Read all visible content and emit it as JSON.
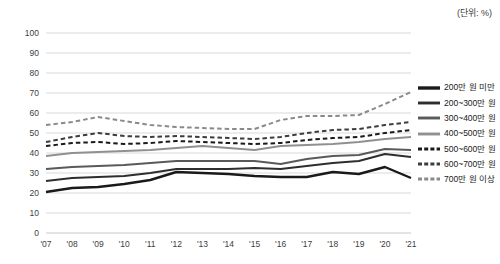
{
  "unit_note": "(단위: %)",
  "legend": {
    "position": "right",
    "items": [
      {
        "label": "200만 원 미만",
        "color": "#1a1a1a",
        "style": "solid",
        "width": 2.6
      },
      {
        "label": "200~300만 원",
        "color": "#2e2e2e",
        "style": "solid",
        "width": 2.1
      },
      {
        "label": "300~400만 원",
        "color": "#5a5a5a",
        "style": "solid",
        "width": 2.1
      },
      {
        "label": "400~500만 원",
        "color": "#909090",
        "style": "solid",
        "width": 2.1
      },
      {
        "label": "500~600만 원",
        "color": "#1a1a1a",
        "style": "dashed",
        "width": 2.1
      },
      {
        "label": "600~700만 원",
        "color": "#3d3d3d",
        "style": "dashed",
        "width": 2.1
      },
      {
        "label": "700만 원 이상",
        "color": "#8a8a8a",
        "style": "dashed",
        "width": 2.1
      }
    ]
  },
  "axis": {
    "y_ticks": [
      "0",
      "10",
      "20",
      "30",
      "40",
      "50",
      "60",
      "70",
      "80",
      "90",
      "100"
    ],
    "x_ticks": [
      "'07",
      "'08",
      "'09",
      "'10",
      "'11",
      "'12",
      "'13",
      "'14",
      "'15",
      "'16",
      "'17",
      "'18",
      "'19",
      "'20",
      "'21"
    ]
  },
  "chart_data": {
    "type": "line",
    "title": "",
    "subtitle": "",
    "xlabel": "",
    "ylabel": "",
    "unit": "%",
    "ylim": [
      0,
      100
    ],
    "ytick_step": 10,
    "grid": true,
    "legend_position": "right",
    "categories": [
      "'07",
      "'08",
      "'09",
      "'10",
      "'11",
      "'12",
      "'13",
      "'14",
      "'15",
      "'16",
      "'17",
      "'18",
      "'19",
      "'20",
      "'21"
    ],
    "series": [
      {
        "name": "200만 원 미만",
        "style": "solid",
        "color": "#1a1a1a",
        "values": [
          20.5,
          22.5,
          23.0,
          24.5,
          26.5,
          30.5,
          30.0,
          29.5,
          28.5,
          28.0,
          28.0,
          30.5,
          29.5,
          33.0,
          27.5
        ]
      },
      {
        "name": "200~300만 원",
        "style": "solid",
        "color": "#2e2e2e",
        "values": [
          26.0,
          27.5,
          28.0,
          28.5,
          30.0,
          32.0,
          32.0,
          32.0,
          32.5,
          32.0,
          33.5,
          35.0,
          36.0,
          39.5,
          38.0
        ]
      },
      {
        "name": "300~400만 원",
        "style": "solid",
        "color": "#5a5a5a",
        "values": [
          32.0,
          33.0,
          33.5,
          34.0,
          35.0,
          36.0,
          36.0,
          36.0,
          36.0,
          34.5,
          37.0,
          38.5,
          39.0,
          42.0,
          41.5
        ]
      },
      {
        "name": "400~500만 원",
        "style": "solid",
        "color": "#909090",
        "values": [
          38.5,
          40.0,
          40.5,
          41.0,
          41.5,
          42.5,
          43.5,
          42.5,
          41.5,
          43.5,
          44.0,
          44.5,
          45.5,
          47.0,
          48.0
        ]
      },
      {
        "name": "500~600만 원",
        "style": "dashed",
        "color": "#1a1a1a",
        "values": [
          43.5,
          45.0,
          45.5,
          44.5,
          45.0,
          46.0,
          45.5,
          45.0,
          44.5,
          45.0,
          46.5,
          47.5,
          48.0,
          50.0,
          51.5
        ]
      },
      {
        "name": "600~700만 원",
        "style": "dashed",
        "color": "#3d3d3d",
        "values": [
          45.5,
          48.0,
          50.0,
          48.5,
          48.0,
          48.5,
          48.0,
          47.5,
          47.0,
          48.0,
          50.0,
          51.5,
          52.0,
          54.0,
          55.5
        ]
      },
      {
        "name": "700만 원 이상",
        "style": "dashed",
        "color": "#8a8a8a",
        "values": [
          54.0,
          55.5,
          58.0,
          56.0,
          54.0,
          53.0,
          52.5,
          52.0,
          52.0,
          56.5,
          58.5,
          58.5,
          59.0,
          64.5,
          70.5
        ]
      }
    ]
  }
}
